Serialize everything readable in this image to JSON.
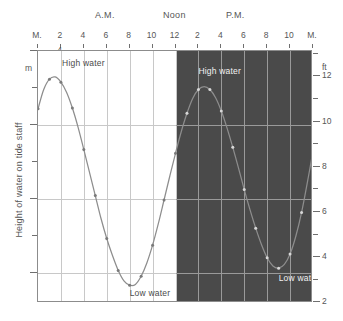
{
  "chart_data": {
    "type": "line",
    "title": "",
    "subtitle": "",
    "xlabel": "",
    "ylabel": "Height of water on tide staff",
    "ylabel_right": "ft",
    "ylabel_left_unit": "m",
    "grid": true,
    "legend": "none",
    "xlim": [
      0,
      24
    ],
    "ylim": [
      0.6,
      4.0
    ],
    "ylim_right_ft": [
      2,
      13.1
    ],
    "x_tick_labels": [
      "M.",
      "2",
      "4",
      "6",
      "8",
      "10",
      "12",
      "2",
      "4",
      "6",
      "8",
      "10",
      "M."
    ],
    "x_tick_values": [
      0,
      2,
      4,
      6,
      8,
      10,
      12,
      14,
      16,
      18,
      20,
      22,
      24
    ],
    "y_tick_labels_m": [
      "1",
      "2",
      "3",
      "4"
    ],
    "y_tick_values_m": [
      1,
      2,
      3,
      4
    ],
    "y_minor_ticks_m": [
      1.5,
      2.5,
      3.5
    ],
    "y_tick_labels_ft": [
      "2",
      "4",
      "6",
      "8",
      "10",
      "12"
    ],
    "y_tick_values_ft": [
      2,
      4,
      6,
      8,
      10,
      12
    ],
    "y_minor_ticks_ft": [
      3,
      5,
      7,
      9,
      11,
      13
    ],
    "period_labels": [
      {
        "text": "A.M.",
        "x": 5
      },
      {
        "text": "Noon",
        "x": 11.4
      },
      {
        "text": "P.M.",
        "x": 17
      },
      {
        "text": "",
        "x": 0
      }
    ],
    "night_region": {
      "start_x": 12,
      "end_x": 24,
      "color": "#4a4a4a"
    },
    "series": [
      {
        "name": "Tide height",
        "color": "#8d8d8d",
        "marker": "dot",
        "x": [
          0.0,
          0.5,
          1.0,
          1.5,
          2.0,
          2.5,
          3.0,
          3.5,
          4.0,
          4.5,
          5.0,
          5.5,
          6.0,
          6.5,
          7.0,
          7.5,
          8.0,
          8.5,
          9.0,
          9.5,
          10.0,
          10.5,
          11.0,
          11.5,
          12.0,
          12.5,
          13.0,
          13.5,
          14.0,
          14.5,
          15.0,
          15.5,
          16.0,
          16.5,
          17.0,
          17.5,
          18.0,
          18.5,
          19.0,
          19.5,
          20.0,
          20.5,
          21.0,
          21.5,
          22.0,
          22.5,
          23.0,
          23.5,
          24.0
        ],
        "y": [
          3.22,
          3.48,
          3.62,
          3.65,
          3.58,
          3.44,
          3.23,
          2.97,
          2.67,
          2.36,
          2.05,
          1.74,
          1.47,
          1.24,
          1.04,
          0.9,
          0.84,
          0.85,
          0.96,
          1.14,
          1.38,
          1.67,
          1.99,
          2.31,
          2.62,
          2.91,
          3.16,
          3.36,
          3.48,
          3.52,
          3.48,
          3.37,
          3.19,
          2.96,
          2.7,
          2.42,
          2.13,
          1.86,
          1.61,
          1.39,
          1.21,
          1.1,
          1.07,
          1.12,
          1.26,
          1.5,
          1.82,
          2.22,
          2.65
        ]
      }
    ],
    "annotations": [
      {
        "text": "High water",
        "x": 2.1,
        "y": 3.82,
        "style": "light"
      },
      {
        "text": "Low water",
        "x": 8.0,
        "y": 0.72,
        "style": "light"
      },
      {
        "text": "High water",
        "x": 14.0,
        "y": 3.72,
        "style": "dark"
      },
      {
        "text": "Low water",
        "x": 21.0,
        "y": 0.92,
        "style": "dark"
      }
    ]
  }
}
